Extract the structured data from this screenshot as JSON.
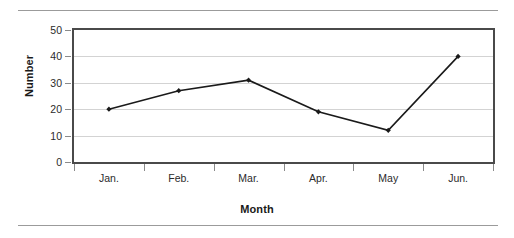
{
  "chart_data": {
    "type": "line",
    "title": "",
    "xlabel": "Month",
    "ylabel": "Number",
    "categories": [
      "Jan.",
      "Feb.",
      "Mar.",
      "Apr.",
      "May",
      "Jun."
    ],
    "values": [
      20,
      27,
      31,
      19,
      12,
      40
    ],
    "series": [
      {
        "name": "Number",
        "values": [
          20,
          27,
          31,
          19,
          12,
          40
        ]
      }
    ],
    "ylim": [
      0,
      50
    ],
    "yticks": [
      0,
      10,
      20,
      30,
      40,
      50
    ],
    "ytick_labels": [
      "0",
      "10",
      "20",
      "30",
      "40",
      "50"
    ],
    "grid": true,
    "grid_axis": "y",
    "legend": false,
    "legend_position": "none",
    "marker": "diamond",
    "line_color": "#1a1a1a",
    "marker_color": "#1a1a1a",
    "grid_color": "#d3d3d3",
    "frame_color": "#4a4a4a",
    "background_color": "#ffffff"
  },
  "figure": {
    "rule_color": "#9b9b9b",
    "top_rule_label": "top-divider",
    "bottom_rule_label": "bottom-divider"
  }
}
